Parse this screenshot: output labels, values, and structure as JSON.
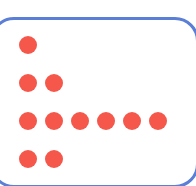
{
  "card": {
    "border_color": "#5b7fd6",
    "dot_color": "#f5574b"
  },
  "rows": [
    {
      "count": 1,
      "y": 45
    },
    {
      "count": 2,
      "y": 83
    },
    {
      "count": 6,
      "y": 121
    },
    {
      "count": 2,
      "y": 159
    }
  ],
  "dot_layout": {
    "first_x": 28,
    "pitch": 26,
    "diameter": 18
  }
}
